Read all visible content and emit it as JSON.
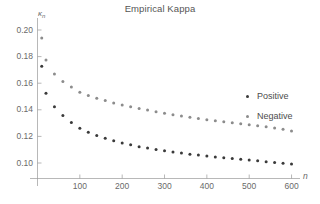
{
  "chart_data": {
    "type": "scatter",
    "title": "Empirical Kappa",
    "xlabel": "n",
    "ylabel": "κ",
    "ylabel_sub": "n",
    "xlim": [
      0,
      620
    ],
    "ylim": [
      0.092,
      0.206
    ],
    "grid": false,
    "legend_position": "right",
    "xticks": [
      100,
      200,
      300,
      400,
      500,
      600
    ],
    "xtick_labels": [
      "100",
      "200",
      "300",
      "400",
      "500",
      "600"
    ],
    "yticks": [
      0.1,
      0.12,
      0.14,
      0.16,
      0.18,
      0.2
    ],
    "ytick_labels": [
      "0.10",
      "0.12",
      "0.14",
      "0.16",
      "0.18",
      "0.20"
    ],
    "series": [
      {
        "name": "Positive",
        "color": "#3a3a3a",
        "marker": "dot",
        "x": [
          10,
          20,
          40,
          60,
          80,
          100,
          120,
          140,
          160,
          180,
          200,
          220,
          240,
          260,
          280,
          300,
          320,
          340,
          360,
          380,
          400,
          420,
          440,
          460,
          480,
          500,
          520,
          540,
          560,
          580,
          600
        ],
        "y": [
          0.1727,
          0.1525,
          0.1422,
          0.1357,
          0.1305,
          0.1262,
          0.1232,
          0.1207,
          0.1186,
          0.1167,
          0.115,
          0.1137,
          0.1123,
          0.1112,
          0.1101,
          0.1092,
          0.1083,
          0.1075,
          0.1066,
          0.106,
          0.1053,
          0.1046,
          0.104,
          0.1034,
          0.1028,
          0.1022,
          0.1016,
          0.101,
          0.1004,
          0.0998,
          0.0992
        ]
      },
      {
        "name": "Negative",
        "color": "#8c8c8c",
        "marker": "dot",
        "x": [
          10,
          20,
          40,
          60,
          80,
          100,
          120,
          140,
          160,
          180,
          200,
          220,
          240,
          260,
          280,
          300,
          320,
          340,
          360,
          380,
          400,
          420,
          440,
          460,
          480,
          500,
          520,
          540,
          560,
          580,
          600
        ],
        "y": [
          0.194,
          0.1775,
          0.167,
          0.1612,
          0.1572,
          0.1532,
          0.1508,
          0.1486,
          0.1469,
          0.1452,
          0.1437,
          0.1423,
          0.141,
          0.1398,
          0.1386,
          0.1375,
          0.1363,
          0.1354,
          0.1344,
          0.1335,
          0.1326,
          0.1318,
          0.131,
          0.1302,
          0.1295,
          0.1288,
          0.128,
          0.1272,
          0.1263,
          0.1254,
          0.124
        ]
      }
    ]
  },
  "legend": {
    "items": [
      {
        "label": "Positive"
      },
      {
        "label": "Negative"
      }
    ]
  }
}
